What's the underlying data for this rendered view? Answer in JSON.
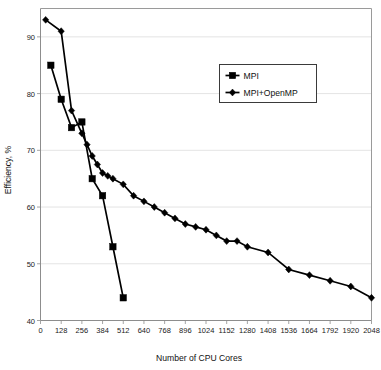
{
  "chart_data": {
    "type": "line",
    "title": "",
    "xlabel": "Number of CPU Cores",
    "ylabel": "Efficiency, %",
    "xlim": [
      0,
      2048
    ],
    "ylim": [
      40,
      95
    ],
    "grid": true,
    "legend_position": "top-right-inside",
    "xticks": [
      0,
      128,
      256,
      384,
      512,
      640,
      768,
      896,
      1024,
      1152,
      1280,
      1408,
      1536,
      1664,
      1792,
      1920,
      2048
    ],
    "xtick_labels": [
      "0",
      "128",
      "256",
      "384",
      "512",
      "640",
      "768",
      "896",
      "1024",
      "1152",
      "1280",
      "1408",
      "1536",
      "1664",
      "1792",
      "1920",
      "2048"
    ],
    "yticks": [
      40,
      50,
      60,
      70,
      80,
      90
    ],
    "ytick_labels": [
      "40",
      "50",
      "60",
      "70",
      "80",
      "90"
    ],
    "series": [
      {
        "name": "MPI",
        "marker": "square",
        "x": [
          64,
          128,
          192,
          256,
          320,
          384,
          448,
          512
        ],
        "values": [
          85,
          79,
          74,
          75,
          65,
          62,
          53,
          44
        ]
      },
      {
        "name": "MPI+OpenMP",
        "marker": "diamond",
        "x": [
          32,
          128,
          192,
          256,
          288,
          320,
          352,
          384,
          416,
          448,
          512,
          576,
          640,
          704,
          768,
          832,
          896,
          960,
          1024,
          1088,
          1152,
          1216,
          1280,
          1408,
          1536,
          1664,
          1792,
          1920,
          2048
        ],
        "values": [
          93,
          91,
          77,
          73,
          71,
          69,
          67.5,
          66,
          65.5,
          65,
          64,
          62,
          61,
          60,
          59,
          58,
          57,
          56.5,
          56,
          55,
          54,
          54,
          53,
          52,
          49,
          48,
          47,
          46,
          44
        ]
      }
    ]
  },
  "legend": {
    "entries": [
      {
        "label": "MPI",
        "marker": "square"
      },
      {
        "label": "MPI+OpenMP",
        "marker": "diamond"
      }
    ]
  }
}
